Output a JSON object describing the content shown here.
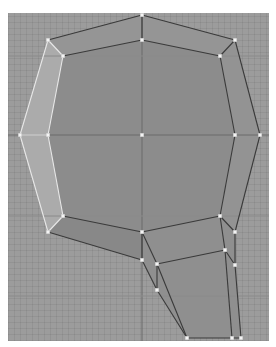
{
  "viewport": {
    "background": "#9c9c9c",
    "grid_color": "#8a8a8a",
    "axis_color": "#6a6a6a",
    "face_color": "#8c8c8c",
    "side_face_color": "#ababab",
    "edge_color": "#3a3a3a",
    "selected_edge_color": "#e8e8e8",
    "vertex_color": "#f4f4f4"
  },
  "axes": {
    "horizontal_y": 135,
    "vertical_x": 142,
    "extra_grid_y": [
      56,
      216,
      296
    ]
  },
  "mesh": {
    "faces": [
      {
        "name": "front-face",
        "points": "63,56 142,40 220,56 235,135 220,216 142,232 63,216 48,135",
        "fill": "#8c8c8c"
      },
      {
        "name": "top-face",
        "points": "48,40 142,15 235,40 220,56 142,40 63,56",
        "fill": "#959595"
      },
      {
        "name": "left-side-face",
        "points": "48,40 63,56 48,135 63,216 48,232 20,135",
        "fill": "#ababab"
      },
      {
        "name": "right-side-face",
        "points": "235,40 260,135 235,232 220,216 235,135 220,56",
        "fill": "#939393"
      },
      {
        "name": "bottom-face",
        "points": "48,232 63,216 142,232 220,216 235,232 142,260",
        "fill": "#888888"
      },
      {
        "name": "neck-face",
        "points": "142,232 220,216 235,232 241,338 187,338 157,290 142,260",
        "fill": "#8f8f8f"
      }
    ],
    "edges": [
      {
        "x1": 48,
        "y1": 40,
        "x2": 142,
        "y2": 15,
        "selected": false
      },
      {
        "x1": 142,
        "y1": 15,
        "x2": 235,
        "y2": 40,
        "selected": false
      },
      {
        "x1": 63,
        "y1": 56,
        "x2": 142,
        "y2": 40,
        "selected": false
      },
      {
        "x1": 142,
        "y1": 40,
        "x2": 220,
        "y2": 56,
        "selected": false
      },
      {
        "x1": 142,
        "y1": 15,
        "x2": 142,
        "y2": 40,
        "selected": false
      },
      {
        "x1": 235,
        "y1": 40,
        "x2": 220,
        "y2": 56,
        "selected": false
      },
      {
        "x1": 235,
        "y1": 40,
        "x2": 260,
        "y2": 135,
        "selected": false
      },
      {
        "x1": 220,
        "y1": 56,
        "x2": 235,
        "y2": 135,
        "selected": false
      },
      {
        "x1": 260,
        "y1": 135,
        "x2": 235,
        "y2": 232,
        "selected": false
      },
      {
        "x1": 235,
        "y1": 135,
        "x2": 220,
        "y2": 216,
        "selected": false
      },
      {
        "x1": 220,
        "y1": 216,
        "x2": 235,
        "y2": 232,
        "selected": false
      },
      {
        "x1": 63,
        "y1": 216,
        "x2": 142,
        "y2": 232,
        "selected": false
      },
      {
        "x1": 142,
        "y1": 232,
        "x2": 220,
        "y2": 216,
        "selected": false
      },
      {
        "x1": 48,
        "y1": 232,
        "x2": 142,
        "y2": 260,
        "selected": false
      },
      {
        "x1": 142,
        "y1": 232,
        "x2": 142,
        "y2": 260,
        "selected": false
      },
      {
        "x1": 142,
        "y1": 232,
        "x2": 157,
        "y2": 264,
        "selected": false
      },
      {
        "x1": 157,
        "y1": 264,
        "x2": 225,
        "y2": 250,
        "selected": false
      },
      {
        "x1": 157,
        "y1": 264,
        "x2": 157,
        "y2": 290,
        "selected": false
      },
      {
        "x1": 157,
        "y1": 264,
        "x2": 187,
        "y2": 338,
        "selected": false
      },
      {
        "x1": 142,
        "y1": 260,
        "x2": 157,
        "y2": 290,
        "selected": false
      },
      {
        "x1": 157,
        "y1": 290,
        "x2": 187,
        "y2": 338,
        "selected": false
      },
      {
        "x1": 220,
        "y1": 216,
        "x2": 225,
        "y2": 250,
        "selected": false
      },
      {
        "x1": 225,
        "y1": 250,
        "x2": 232,
        "y2": 338,
        "selected": false
      },
      {
        "x1": 235,
        "y1": 232,
        "x2": 235,
        "y2": 265,
        "selected": false
      },
      {
        "x1": 235,
        "y1": 265,
        "x2": 241,
        "y2": 338,
        "selected": false
      },
      {
        "x1": 225,
        "y1": 250,
        "x2": 235,
        "y2": 265,
        "selected": false
      },
      {
        "x1": 187,
        "y1": 338,
        "x2": 241,
        "y2": 338,
        "selected": false
      },
      {
        "x1": 48,
        "y1": 40,
        "x2": 63,
        "y2": 56,
        "selected": true
      },
      {
        "x1": 48,
        "y1": 40,
        "x2": 20,
        "y2": 135,
        "selected": true
      },
      {
        "x1": 63,
        "y1": 56,
        "x2": 48,
        "y2": 135,
        "selected": true
      },
      {
        "x1": 20,
        "y1": 135,
        "x2": 48,
        "y2": 232,
        "selected": true
      },
      {
        "x1": 48,
        "y1": 135,
        "x2": 63,
        "y2": 216,
        "selected": true
      },
      {
        "x1": 20,
        "y1": 135,
        "x2": 48,
        "y2": 135,
        "selected": true
      },
      {
        "x1": 63,
        "y1": 216,
        "x2": 48,
        "y2": 232,
        "selected": true
      }
    ],
    "vertices": [
      {
        "x": 48,
        "y": 40
      },
      {
        "x": 63,
        "y": 56
      },
      {
        "x": 142,
        "y": 15
      },
      {
        "x": 142,
        "y": 40
      },
      {
        "x": 220,
        "y": 56
      },
      {
        "x": 235,
        "y": 40
      },
      {
        "x": 20,
        "y": 135
      },
      {
        "x": 48,
        "y": 135
      },
      {
        "x": 142,
        "y": 135
      },
      {
        "x": 235,
        "y": 135
      },
      {
        "x": 260,
        "y": 135
      },
      {
        "x": 48,
        "y": 232
      },
      {
        "x": 63,
        "y": 216
      },
      {
        "x": 142,
        "y": 232
      },
      {
        "x": 220,
        "y": 216
      },
      {
        "x": 235,
        "y": 232
      },
      {
        "x": 142,
        "y": 260
      },
      {
        "x": 157,
        "y": 264
      },
      {
        "x": 157,
        "y": 290
      },
      {
        "x": 225,
        "y": 250
      },
      {
        "x": 235,
        "y": 265
      },
      {
        "x": 187,
        "y": 338
      },
      {
        "x": 232,
        "y": 338
      },
      {
        "x": 241,
        "y": 338
      }
    ]
  }
}
